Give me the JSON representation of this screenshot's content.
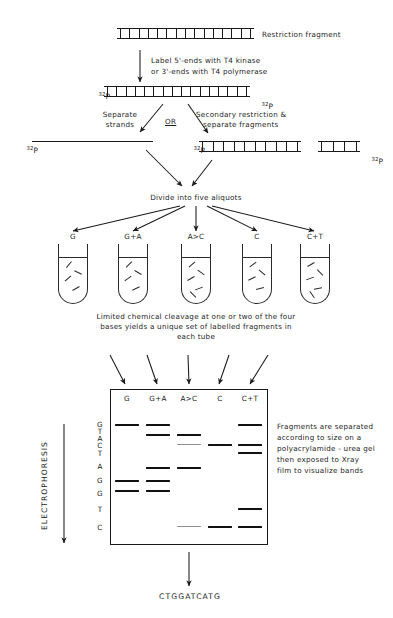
{
  "diagram": {
    "steps": {
      "restriction_fragment_label": "Restriction fragment",
      "label_step_line1": "Label 5'-ends with T4 kinase",
      "label_step_line2": "or 3'-ends with T4 polymerase",
      "separate_strands_line1": "Separate",
      "separate_strands_line2": "strands",
      "or_label": "OR",
      "secondary_line1": "Secondary restriction &",
      "secondary_line2": "separate fragments",
      "divide_label": "Divide into five aliquots",
      "cleavage_line1": "Limited chemical cleavage at one or two of the four",
      "cleavage_line2": "bases yields a unique set of labelled fragments in",
      "cleavage_line3": "each tube",
      "gel_note_line1": "Fragments are separated",
      "gel_note_line2": "according to size on a",
      "gel_note_line3": "polyacrylamide - urea gel",
      "gel_note_line4": "then exposed to Xray",
      "gel_note_line5": "film to visualize bands",
      "electrophoresis_label": "ELECTROPHORESIS",
      "final_sequence": "CTGGATCATG"
    },
    "isotope_labels": {
      "p32": "32P",
      "superscript": "32",
      "base": "P"
    },
    "reaction_tubes": [
      {
        "id": "tube-g",
        "label": "G",
        "fragments": 4
      },
      {
        "id": "tube-ga",
        "label": "G+A",
        "fragments": 4
      },
      {
        "id": "tube-ac",
        "label": "A>C",
        "fragments": 5
      },
      {
        "id": "tube-c",
        "label": "C",
        "fragments": 4
      },
      {
        "id": "tube-ct",
        "label": "C+T",
        "fragments": 5
      }
    ],
    "gel": {
      "lanes": [
        "G",
        "G+A",
        "A>C",
        "C",
        "C+T"
      ],
      "sequence_read": [
        "G",
        "T",
        "A",
        "C",
        "T",
        "A",
        "G",
        "G",
        "T",
        "C"
      ],
      "bands": [
        {
          "lane": 0,
          "row": 0,
          "intensity": "strong"
        },
        {
          "lane": 1,
          "row": 0,
          "intensity": "strong"
        },
        {
          "lane": 4,
          "row": 0,
          "intensity": "strong"
        },
        {
          "lane": 1,
          "row": 1,
          "intensity": "strong"
        },
        {
          "lane": 2,
          "row": 1,
          "intensity": "strong"
        },
        {
          "lane": 2,
          "row": 2,
          "intensity": "faint"
        },
        {
          "lane": 3,
          "row": 2,
          "intensity": "strong"
        },
        {
          "lane": 4,
          "row": 2,
          "intensity": "strong"
        },
        {
          "lane": 4,
          "row": 3,
          "intensity": "strong"
        },
        {
          "lane": 1,
          "row": 4,
          "intensity": "strong"
        },
        {
          "lane": 2,
          "row": 4,
          "intensity": "strong"
        },
        {
          "lane": 0,
          "row": 5,
          "intensity": "strong"
        },
        {
          "lane": 1,
          "row": 5,
          "intensity": "strong"
        },
        {
          "lane": 0,
          "row": 6,
          "intensity": "strong"
        },
        {
          "lane": 1,
          "row": 6,
          "intensity": "strong"
        },
        {
          "lane": 4,
          "row": 7,
          "intensity": "strong"
        },
        {
          "lane": 2,
          "row": 8,
          "intensity": "faint"
        },
        {
          "lane": 3,
          "row": 8,
          "intensity": "strong"
        },
        {
          "lane": 4,
          "row": 8,
          "intensity": "strong"
        }
      ]
    },
    "colors": {
      "ink": "#1a1a1a",
      "band_strong": "#111111",
      "band_faint": "#8f8f8f",
      "background": "#ffffff"
    }
  }
}
